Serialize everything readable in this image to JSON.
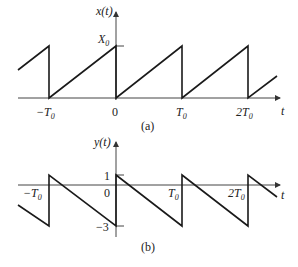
{
  "figure_a": {
    "caption": "(a)",
    "y_label": "x(t)",
    "x_label": "t",
    "peak_label": "X0",
    "peak_label_main": "X",
    "peak_label_sub": "0",
    "ticks": [
      {
        "main": "−T",
        "sub": "0"
      },
      {
        "main": "0",
        "sub": ""
      },
      {
        "main": "T",
        "sub": "0"
      },
      {
        "main": "2T",
        "sub": "0"
      }
    ],
    "description": "Sawtooth: rises linearly from 0 to X0 over each period T0, then drops to 0"
  },
  "figure_b": {
    "caption": "(b)",
    "y_label": "y(t)",
    "x_label": "t",
    "level_top": "1",
    "level_bottom": "−3",
    "origin_label": "0",
    "ticks": [
      {
        "main": "−T",
        "sub": "0"
      },
      {
        "main": "T",
        "sub": "0"
      },
      {
        "main": "2T",
        "sub": "0"
      }
    ],
    "description": "Sawtooth: falls linearly from 1 to -3 over each period T0, then jumps back to 1"
  },
  "colors": {
    "line": "#1a1a1a",
    "axis": "#444444"
  }
}
